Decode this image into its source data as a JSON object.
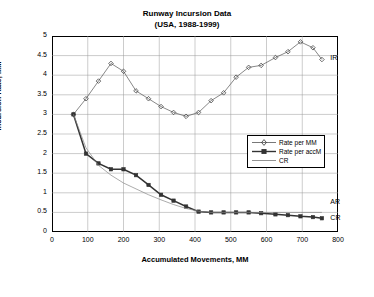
{
  "chart_data": {
    "type": "line",
    "title": "Runway Incursion Data",
    "subtitle": "(USA, 1988-1999)",
    "xlabel": "Accumulated Movements, MM",
    "ylabel": "Incursion Rate, MM",
    "xlim": [
      0,
      800
    ],
    "ylim": [
      0,
      5
    ],
    "xticks": [
      0,
      100,
      200,
      300,
      400,
      500,
      600,
      700,
      800
    ],
    "yticks": [
      "0",
      "0.5",
      "1",
      "1.5",
      "2",
      "2.5",
      "3",
      "3.5",
      "4",
      "4.5",
      "5"
    ],
    "grid": true,
    "legend_position": "center-right",
    "series": [
      {
        "name": "Rate per MM",
        "marker": "diamond",
        "points": [
          [
            60,
            3.0
          ],
          [
            95,
            3.4
          ],
          [
            130,
            3.85
          ],
          [
            165,
            4.3
          ],
          [
            200,
            4.1
          ],
          [
            235,
            3.6
          ],
          [
            270,
            3.4
          ],
          [
            305,
            3.2
          ],
          [
            340,
            3.05
          ],
          [
            375,
            2.95
          ],
          [
            410,
            3.05
          ],
          [
            445,
            3.35
          ],
          [
            480,
            3.55
          ],
          [
            515,
            3.95
          ],
          [
            550,
            4.2
          ],
          [
            585,
            4.25
          ],
          [
            625,
            4.45
          ],
          [
            660,
            4.6
          ],
          [
            695,
            4.85
          ],
          [
            730,
            4.7
          ],
          [
            755,
            4.4
          ]
        ]
      },
      {
        "name": "Rate per accM",
        "marker": "square",
        "points": [
          [
            60,
            3.0
          ],
          [
            95,
            2.0
          ],
          [
            130,
            1.75
          ],
          [
            165,
            1.6
          ],
          [
            200,
            1.6
          ],
          [
            235,
            1.45
          ],
          [
            270,
            1.2
          ],
          [
            305,
            0.95
          ],
          [
            340,
            0.8
          ],
          [
            375,
            0.65
          ],
          [
            410,
            0.52
          ],
          [
            445,
            0.5
          ],
          [
            480,
            0.5
          ],
          [
            515,
            0.5
          ],
          [
            550,
            0.5
          ],
          [
            585,
            0.48
          ],
          [
            625,
            0.45
          ],
          [
            660,
            0.43
          ],
          [
            695,
            0.4
          ],
          [
            730,
            0.38
          ],
          [
            755,
            0.35
          ]
        ]
      },
      {
        "name": "CR",
        "marker": "none",
        "points": [
          [
            60,
            3.0
          ],
          [
            95,
            2.15
          ],
          [
            130,
            1.7
          ],
          [
            165,
            1.45
          ],
          [
            200,
            1.25
          ],
          [
            235,
            1.1
          ],
          [
            270,
            0.95
          ],
          [
            305,
            0.82
          ],
          [
            340,
            0.7
          ],
          [
            375,
            0.6
          ],
          [
            410,
            0.53
          ],
          [
            445,
            0.5
          ],
          [
            480,
            0.5
          ],
          [
            515,
            0.5
          ],
          [
            550,
            0.5
          ],
          [
            585,
            0.5
          ],
          [
            625,
            0.5
          ],
          [
            660,
            0.5
          ],
          [
            695,
            0.5
          ],
          [
            730,
            0.5
          ],
          [
            755,
            0.5
          ]
        ]
      }
    ],
    "annotations": [
      {
        "text": "IR",
        "x": 773,
        "y": 4.42
      },
      {
        "text": "AR",
        "x": 773,
        "y": 0.75
      },
      {
        "text": "CR",
        "x": 773,
        "y": 0.33
      }
    ]
  },
  "legend": {
    "items": [
      {
        "label": "Rate per MM"
      },
      {
        "label": "Rate per accM"
      },
      {
        "label": "CR"
      }
    ]
  }
}
